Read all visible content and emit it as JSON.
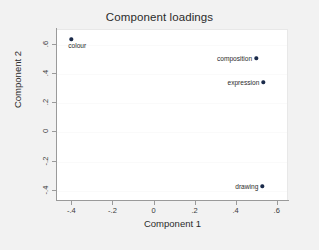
{
  "chart_data": {
    "type": "scatter",
    "title": "Component loadings",
    "xlabel": "Component 1",
    "ylabel": "Component 2",
    "xlim": [
      -0.47,
      0.655
    ],
    "ylim": [
      -0.47,
      0.7
    ],
    "xticks": [
      -0.4,
      -0.2,
      0,
      0.2,
      0.4,
      0.6
    ],
    "xticklabels": [
      "-.4",
      "-.2",
      "0",
      ".2",
      ".4",
      ".6"
    ],
    "yticks": [
      -0.4,
      -0.2,
      0,
      0.2,
      0.4,
      0.6
    ],
    "yticklabels": [
      "-.4",
      "-.2",
      "0",
      ".2",
      ".4",
      ".6"
    ],
    "grid": "horizontal-faint",
    "legend": "none",
    "marker_color": "#1a2a4a",
    "points": [
      {
        "label": "colour",
        "x": -0.4,
        "y": 0.63,
        "label_pos": "below-right"
      },
      {
        "label": "composition",
        "x": 0.5,
        "y": 0.5,
        "label_pos": "left"
      },
      {
        "label": "expression",
        "x": 0.535,
        "y": 0.335,
        "label_pos": "left"
      },
      {
        "label": "drawing",
        "x": 0.53,
        "y": -0.375,
        "label_pos": "left"
      }
    ]
  },
  "figure": {
    "background_color": "#f2f2f2",
    "plot_background_color": "#ffffff",
    "axis_color": "#9a9a9a"
  }
}
